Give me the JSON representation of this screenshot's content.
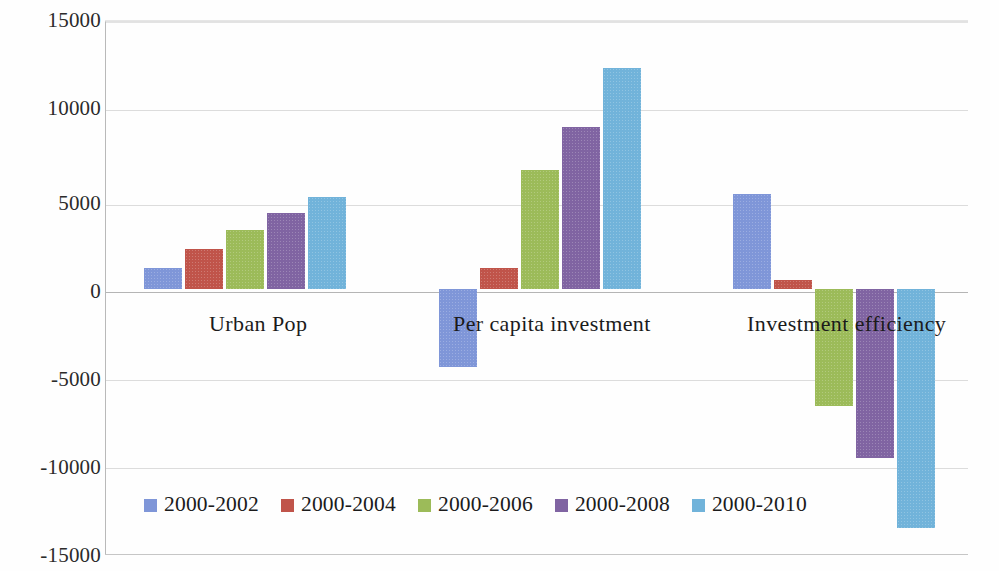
{
  "chart_data": {
    "type": "bar",
    "title": "",
    "xlabel": "",
    "ylabel": "",
    "categories": [
      "Urban Pop",
      "Per capita investment",
      "Investment  efficiency"
    ],
    "series": [
      {
        "name": "2000-2002",
        "color": "#7f96d8",
        "values": [
          1200,
          -4400,
          5350
        ]
      },
      {
        "name": "2000-2004",
        "color": "#c0544a",
        "values": [
          2250,
          1200,
          500
        ]
      },
      {
        "name": "2000-2006",
        "color": "#9cbb59",
        "values": [
          3300,
          6700,
          -6600
        ]
      },
      {
        "name": "2000-2008",
        "color": "#8064a2",
        "values": [
          4250,
          9100,
          -9500
        ]
      },
      {
        "name": "2000-2010",
        "color": "#71b3da",
        "values": [
          5150,
          12400,
          -13400
        ]
      }
    ],
    "ylim": [
      -15000,
      15000
    ],
    "yticks": [
      15000,
      10000,
      5000,
      0,
      -5000,
      -10000,
      -15000
    ],
    "ytick_labels": [
      "15000",
      "10000",
      "5000",
      "0",
      "-5000",
      "-10000",
      "-15000"
    ],
    "grid": true,
    "legend_position": "bottom-left",
    "legend_entries": [
      "2000-2002",
      "2000-2004",
      "2000-2006",
      "2000-2008",
      "2000-2010"
    ],
    "background_color": "#ffffff",
    "gridline_color": "#dcdcdc",
    "axis_color": "#b9b9b9"
  }
}
